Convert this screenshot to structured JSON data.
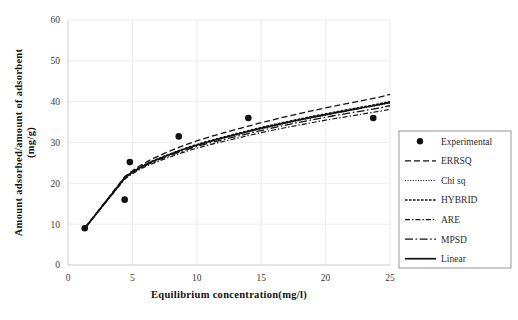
{
  "chart_data": {
    "type": "scatter",
    "title": "",
    "xlabel": "Equilibrium concentration(mg/l)",
    "ylabel": "Amount adsorbed/amount of adsorbent (mg/g)",
    "ylabel_line1": "Amount adsorbed/amount of adsorbent",
    "ylabel_line2": "(mg/g)",
    "xlim": [
      0,
      25
    ],
    "ylim": [
      0,
      60
    ],
    "xticks": [
      0,
      5,
      10,
      15,
      20,
      25
    ],
    "yticks": [
      0,
      10,
      20,
      30,
      40,
      50,
      60
    ],
    "xtick_labels": [
      "0",
      "5",
      "10",
      "15",
      "20",
      "25"
    ],
    "ytick_labels": [
      "0",
      "10",
      "20",
      "30",
      "40",
      "50",
      "60"
    ],
    "grid": true,
    "legend_position": "right-outside",
    "experimental": {
      "name": "Experimental",
      "x": [
        1.3,
        4.4,
        4.8,
        8.6,
        14.0,
        23.7
      ],
      "y": [
        9.0,
        16.0,
        25.2,
        31.5,
        36.0,
        36.0
      ]
    },
    "series": [
      {
        "name": "ERRSQ",
        "style": "dashed",
        "x": [
          1.3,
          4.4,
          8.6,
          14.0,
          19.0,
          23.7,
          25.0
        ],
        "y": [
          9.0,
          21.6,
          28.8,
          34.0,
          37.8,
          40.8,
          41.8
        ]
      },
      {
        "name": "Chi sq",
        "style": "dotted",
        "x": [
          1.3,
          4.4,
          8.6,
          14.0,
          19.0,
          23.7,
          25.0
        ],
        "y": [
          9.0,
          21.3,
          27.8,
          32.6,
          36.1,
          38.9,
          39.7
        ]
      },
      {
        "name": "HYBRID",
        "style": "fine-dashed",
        "x": [
          1.3,
          4.4,
          8.6,
          14.0,
          19.0,
          23.7,
          25.0
        ],
        "y": [
          9.0,
          21.4,
          28.0,
          32.9,
          36.4,
          39.2,
          40.0
        ]
      },
      {
        "name": "ARE",
        "style": "dash-dot",
        "x": [
          1.3,
          4.4,
          8.6,
          14.0,
          19.0,
          23.7,
          25.0
        ],
        "y": [
          9.0,
          21.0,
          27.2,
          31.7,
          34.9,
          37.4,
          38.1
        ]
      },
      {
        "name": "MPSD",
        "style": "long-dash-dot",
        "x": [
          1.3,
          4.4,
          8.6,
          14.0,
          19.0,
          23.7,
          25.0
        ],
        "y": [
          9.0,
          21.2,
          27.6,
          32.2,
          35.6,
          38.2,
          39.0
        ]
      },
      {
        "name": "Linear",
        "style": "solid",
        "x": [
          1.3,
          4.4,
          8.6,
          14.0,
          19.0,
          23.7,
          25.0
        ],
        "y": [
          9.0,
          21.3,
          27.9,
          32.7,
          36.2,
          39.0,
          39.8
        ]
      }
    ]
  },
  "legend": {
    "items": [
      {
        "label": "Experimental",
        "style": "marker"
      },
      {
        "label": "ERRSQ",
        "style": "dashed"
      },
      {
        "label": "Chi sq",
        "style": "dotted"
      },
      {
        "label": "HYBRID",
        "style": "fine-dashed"
      },
      {
        "label": "ARE",
        "style": "dash-dot"
      },
      {
        "label": "MPSD",
        "style": "long-dash-dot"
      },
      {
        "label": "Linear",
        "style": "solid"
      }
    ]
  },
  "colors": {
    "ink": "#111111",
    "grid": "#e9e9e9",
    "axis": "#d2d2d2",
    "legend_border": "#8c8c8c",
    "background": "#ffffff"
  }
}
